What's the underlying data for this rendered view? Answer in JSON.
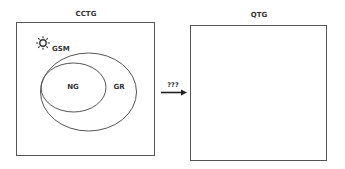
{
  "diagram": {
    "left_panel": {
      "title": "CCTG",
      "icon": "sun-icon",
      "icon_label": "GSM",
      "outer_ellipse_label": "GR",
      "inner_ellipse_label": "NG"
    },
    "arrow": {
      "label": "???",
      "direction": "right"
    },
    "right_panel": {
      "title": "QTG"
    },
    "colors": {
      "stroke": "#555555",
      "text": "#333333",
      "background": "#ffffff"
    }
  }
}
